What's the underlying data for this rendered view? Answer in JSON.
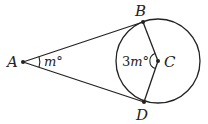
{
  "diagram": {
    "points": {
      "A": {
        "label": "A",
        "x": 23,
        "y": 62
      },
      "B": {
        "label": "B",
        "x": 143,
        "y": 22
      },
      "C": {
        "label": "C",
        "x": 158,
        "y": 61
      },
      "D": {
        "label": "D",
        "x": 144,
        "y": 102
      }
    },
    "circle": {
      "center": "C",
      "radius": 42
    },
    "segments": [
      "AB",
      "AD",
      "BC",
      "CD"
    ],
    "angles": {
      "A": {
        "coef": "",
        "var": "m",
        "unit": "°"
      },
      "C": {
        "coef": "3",
        "var": "m",
        "unit": "°"
      }
    },
    "stroke_color": "#222222"
  }
}
